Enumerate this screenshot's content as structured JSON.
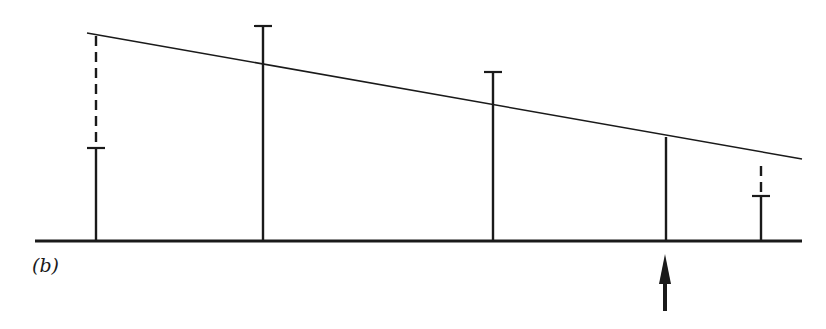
{
  "figure": {
    "label": "(b)",
    "colors": {
      "ink": "#1a1a1a",
      "background": "#ffffff"
    },
    "baseline": {
      "x1": 35,
      "x2": 802,
      "y": 241
    },
    "sloped_line": {
      "x1": 87,
      "y1": 33,
      "x2": 802,
      "y2": 159
    },
    "bars": [
      {
        "x": 96,
        "solid_top": 148,
        "solid_cap": true,
        "dashed_top": 35,
        "dashed_bottom": 142
      },
      {
        "x": 263,
        "solid_top": 26,
        "solid_cap": true
      },
      {
        "x": 493,
        "solid_top": 72,
        "solid_cap": true
      },
      {
        "x": 666,
        "solid_top": 137,
        "solid_cap": false
      },
      {
        "x": 761,
        "solid_top": 196,
        "solid_cap": true,
        "dashed_top": 160,
        "dashed_bottom": 192
      }
    ],
    "arrow": {
      "x": 665,
      "tip_y": 254,
      "tail_y": 311,
      "direction": "up"
    }
  }
}
